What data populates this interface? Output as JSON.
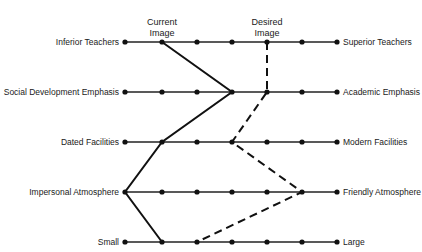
{
  "chart_data": {
    "type": "semantic-differential-profile",
    "headers": {
      "current": [
        "Current",
        "Image"
      ],
      "desired": [
        "Desired",
        "Image"
      ]
    },
    "scale_points": 7,
    "rows": [
      {
        "left": "Inferior Teachers",
        "right": "Superior Teachers",
        "current": 2,
        "desired": 5
      },
      {
        "left": "Social Development Emphasis",
        "right": "Academic Emphasis",
        "current": 4,
        "desired": 5
      },
      {
        "left": "Dated Facilities",
        "right": "Modern Facilities",
        "current": 2,
        "desired": 4
      },
      {
        "left": "Impersonal Atmosphere",
        "right": "Friendly Atmosphere",
        "current": 1,
        "desired": 6
      },
      {
        "left": "Small",
        "right": "Large",
        "current": 2,
        "desired": 3
      }
    ],
    "series": [
      {
        "name": "Current Image",
        "style": "solid",
        "values": [
          2,
          4,
          2,
          1,
          2
        ]
      },
      {
        "name": "Desired Image",
        "style": "dashed",
        "values": [
          5,
          5,
          4,
          6,
          3
        ]
      }
    ]
  },
  "header": {
    "current_line1": "Current",
    "current_line2": "Image",
    "desired_line1": "Desired",
    "desired_line2": "Image"
  },
  "rows": [
    {
      "left": "Inferior Teachers",
      "right": "Superior Teachers"
    },
    {
      "left": "Social Development Emphasis",
      "right": "Academic Emphasis"
    },
    {
      "left": "Dated Facilities",
      "right": "Modern Facilities"
    },
    {
      "left": "Impersonal Atmosphere",
      "right": "Friendly Atmosphere"
    },
    {
      "left": "Small",
      "right": "Large"
    }
  ]
}
